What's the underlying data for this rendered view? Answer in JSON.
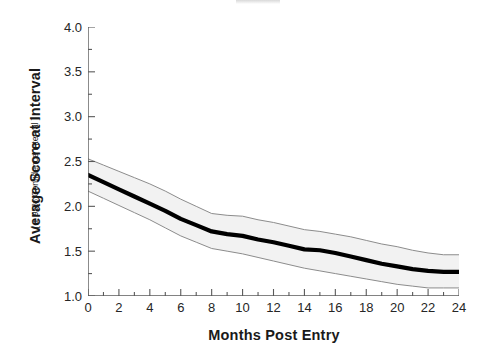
{
  "figure": {
    "background": "#ffffff",
    "title_remnant": ""
  },
  "chart_data": {
    "type": "line",
    "title": "",
    "xlabel": "Months Post Entry",
    "ylabel": "Average Score at Interval",
    "ylabel_sub": "[ ± 95% Confidence Interval ]",
    "xlim": [
      0,
      24
    ],
    "ylim": [
      1.0,
      4.0
    ],
    "xticks": [
      0,
      2,
      4,
      6,
      8,
      10,
      12,
      14,
      16,
      18,
      20,
      22,
      24
    ],
    "xtick_labels": [
      "0",
      "2",
      "4",
      "6",
      "8",
      "10",
      "12",
      "14",
      "16",
      "18",
      "20",
      "22",
      "24"
    ],
    "xminor_step": 1,
    "yticks": [
      1.0,
      1.5,
      2.0,
      2.5,
      3.0,
      3.5,
      4.0
    ],
    "ytick_labels": [
      "1.0",
      "1.5",
      "2.0",
      "2.5",
      "3.0",
      "3.5",
      "4.0"
    ],
    "yminor_step": 0.25,
    "grid": false,
    "legend": null,
    "x": [
      0,
      1,
      2,
      3,
      4,
      5,
      6,
      7,
      8,
      9,
      10,
      11,
      12,
      13,
      14,
      15,
      16,
      17,
      18,
      19,
      20,
      21,
      22,
      23,
      24
    ],
    "series": [
      {
        "name": "Average Score",
        "role": "mean",
        "color": "#000000",
        "linewidth": 4.2,
        "values": [
          2.35,
          2.27,
          2.19,
          2.11,
          2.03,
          1.95,
          1.86,
          1.79,
          1.72,
          1.69,
          1.67,
          1.63,
          1.6,
          1.56,
          1.52,
          1.51,
          1.48,
          1.44,
          1.4,
          1.36,
          1.33,
          1.3,
          1.28,
          1.27,
          1.27
        ]
      },
      {
        "name": "Upper 95% Confidence Limit",
        "role": "ci_upper",
        "color": "#8c8c8c",
        "linewidth": 1,
        "values": [
          2.53,
          2.46,
          2.39,
          2.32,
          2.25,
          2.17,
          2.08,
          2.0,
          1.92,
          1.9,
          1.89,
          1.85,
          1.82,
          1.78,
          1.74,
          1.72,
          1.69,
          1.66,
          1.62,
          1.58,
          1.55,
          1.51,
          1.48,
          1.46,
          1.46
        ]
      },
      {
        "name": "Lower 95% Confidence Limit",
        "role": "ci_lower",
        "color": "#8c8c8c",
        "linewidth": 1,
        "values": [
          2.17,
          2.09,
          2.01,
          1.93,
          1.85,
          1.76,
          1.67,
          1.6,
          1.53,
          1.5,
          1.47,
          1.43,
          1.39,
          1.35,
          1.31,
          1.28,
          1.25,
          1.22,
          1.19,
          1.16,
          1.13,
          1.11,
          1.09,
          1.09,
          1.09
        ]
      }
    ],
    "band": {
      "label": "95% Confidence Interval band",
      "fill": "#f2f2f2",
      "edge": "#8c8c8c"
    },
    "axis": {
      "spine_color": "#595959",
      "tick_color": "#595959"
    }
  }
}
